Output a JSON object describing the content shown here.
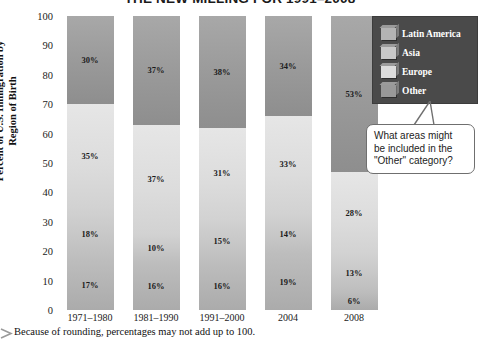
{
  "chart_data": {
    "type": "bar",
    "subtype": "stacked-bar-100",
    "title": "THE NEW MILLING FOR 1991–2008",
    "xlabel": "",
    "ylabel": "Percent of U.S. Immigration by Region of Birth",
    "ylim": [
      0,
      100
    ],
    "ytick_step": 10,
    "yticks": [
      100,
      90,
      80,
      70,
      60,
      50,
      40,
      30,
      20,
      10,
      0
    ],
    "grid": false,
    "legend_position": "top-right",
    "categories": [
      "1971–1980",
      "1981–1990",
      "1991–2000",
      "2004",
      "2008"
    ],
    "series": [
      {
        "name": "Latin America",
        "values": [
          17,
          16,
          16,
          19,
          6
        ]
      },
      {
        "name": "Asia",
        "values": [
          18,
          10,
          15,
          14,
          13
        ]
      },
      {
        "name": "Europe",
        "values": [
          35,
          37,
          31,
          33,
          28
        ]
      },
      {
        "name": "Other",
        "values": [
          30,
          37,
          38,
          34,
          53
        ]
      }
    ],
    "value_label_suffix": "%",
    "note": "Because of rounding, percentages may not add up to 100."
  },
  "legend": {
    "items": [
      {
        "label": "Latin America"
      },
      {
        "label": "Asia"
      },
      {
        "label": "Europe"
      },
      {
        "label": "Other"
      }
    ]
  },
  "callout": {
    "line1": "What areas might",
    "line2": "be included in the",
    "line3": "\"Other\" category?"
  },
  "footnote": {
    "text": "Because of rounding, percentages may not add up to 100."
  },
  "colors": {
    "legend_panel": "#4a4a4a",
    "latin_america": "#b4b4b4",
    "asia": "#c8c8c8",
    "europe": "#dcdcdc",
    "other": "#999999",
    "callout_border": "#6f6f6f"
  }
}
